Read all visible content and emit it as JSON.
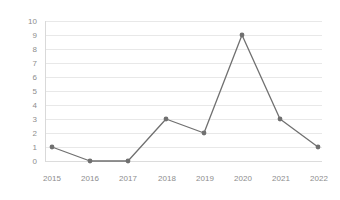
{
  "chart_data": {
    "type": "line",
    "title": "",
    "subtitle": "",
    "xlabel": "",
    "ylabel": "",
    "categories": [
      "2015",
      "2016",
      "2017",
      "2018",
      "2019",
      "2020",
      "2021",
      "2022"
    ],
    "values": [
      1,
      0,
      0,
      3,
      2,
      9,
      3,
      1
    ],
    "series": [
      {
        "name": "",
        "values": [
          1,
          0,
          0,
          3,
          2,
          9,
          3,
          1
        ]
      }
    ],
    "x": [
      "2015",
      "2016",
      "2017",
      "2018",
      "2019",
      "2020",
      "2021",
      "2022"
    ],
    "ylim": [
      0,
      10
    ],
    "ytick_labels": [
      "0",
      "1",
      "2",
      "3",
      "4",
      "5",
      "6",
      "7",
      "8",
      "9",
      "10"
    ],
    "ytick_values": [
      0,
      1,
      2,
      3,
      4,
      5,
      6,
      7,
      8,
      9,
      10
    ],
    "xtick_labels": [
      "2015",
      "2016",
      "2017",
      "2018",
      "2019",
      "2020",
      "2021",
      "2022"
    ],
    "grid": true,
    "grid_axis": "y",
    "legend": false,
    "legend_position": "none",
    "markers": true,
    "line_color": "#707070",
    "marker_color": "#707070",
    "grid_color": "#e8e8e8",
    "axis_color": "#d9d9d9",
    "tick_label_color": "#8d8d8d",
    "background_color": "#ffffff"
  }
}
